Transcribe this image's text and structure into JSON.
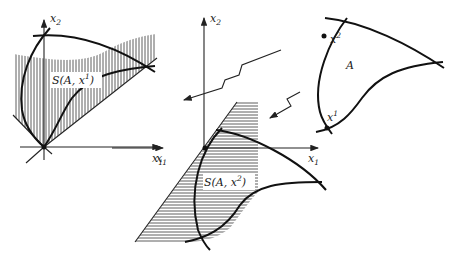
{
  "figure": {
    "left_panel": {
      "axis_x_label": "x",
      "axis_x_sub": "1",
      "axis_y_label": "x",
      "axis_y_sub": "2",
      "region_label": "S(A, x",
      "region_sup": "1",
      "region_close": ")",
      "hatching": "vertical"
    },
    "middle_panel": {
      "axis_x_label_left": "x",
      "axis_x_sub_left": "1",
      "axis_x_label": "x",
      "axis_x_sub": "1",
      "axis_y_label": "x",
      "axis_y_sub": "2",
      "region_label": "S(A, x",
      "region_sup": "2",
      "region_close": ")",
      "hatching": "horizontal"
    },
    "right_panel": {
      "set_label": "A",
      "point1_label": "x",
      "point1_sup": "1",
      "point2_label": "x",
      "point2_sup": "2"
    },
    "colors": {
      "ink": "#111111",
      "background": "#ffffff"
    }
  }
}
